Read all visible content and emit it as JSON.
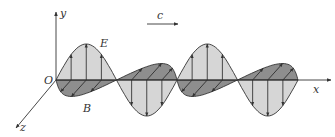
{
  "diagram": {
    "labels": {
      "origin": "O",
      "x_axis": "x",
      "y_axis": "y",
      "z_axis": "z",
      "electric_field": "E",
      "magnetic_field": "B",
      "velocity": "c"
    },
    "colors": {
      "e_fill": "#d3d3d3",
      "b_fill": "#8e8e8e",
      "stroke": "#333333",
      "background": "#ffffff"
    },
    "geometry": {
      "origin": [
        56,
        80
      ],
      "x_axis_end": [
        331,
        80
      ],
      "y_axis_end": [
        56,
        12
      ],
      "z_axis_end": [
        16,
        128
      ],
      "half_period_px": 60.5,
      "e_amplitude_px": 36,
      "b_amplitude_px": 30,
      "half_periods": 4
    }
  }
}
